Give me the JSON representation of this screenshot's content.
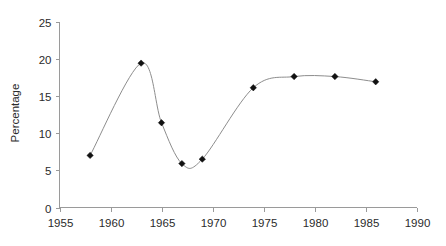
{
  "chart_data": {
    "type": "line",
    "title": "",
    "subtitle": "",
    "xlabel": "",
    "ylabel": "Percentage",
    "xlim": [
      1955,
      1990
    ],
    "ylim": [
      0,
      25
    ],
    "grid": false,
    "legend": null,
    "marker_style": "filled-diamond",
    "line_style": "smooth-spline",
    "x_ticks": [
      1955,
      1960,
      1965,
      1970,
      1975,
      1980,
      1985,
      1990
    ],
    "x_tick_labels": [
      "1955",
      "1960",
      "1965",
      "1970",
      "1975",
      "1980",
      "1985",
      "1990"
    ],
    "y_ticks": [
      0,
      5,
      10,
      15,
      20,
      25
    ],
    "y_tick_labels": [
      "0",
      "5",
      "10",
      "15",
      "20",
      "25"
    ],
    "series": [
      {
        "name": "Percentage",
        "color": "#8d8d8d",
        "marker_color": "#111111",
        "x": [
          1958,
          1963,
          1965,
          1967,
          1969,
          1974,
          1978,
          1982,
          1986
        ],
        "values": [
          7.0,
          19.4,
          11.4,
          5.9,
          6.5,
          16.1,
          17.6,
          17.6,
          16.9
        ],
        "points": [
          {
            "x": 1958,
            "y": 7.0
          },
          {
            "x": 1963,
            "y": 19.4
          },
          {
            "x": 1965,
            "y": 11.4
          },
          {
            "x": 1967,
            "y": 5.9
          },
          {
            "x": 1969,
            "y": 6.5
          },
          {
            "x": 1974,
            "y": 16.1
          },
          {
            "x": 1978,
            "y": 17.6
          },
          {
            "x": 1982,
            "y": 17.6
          },
          {
            "x": 1986,
            "y": 16.9
          }
        ]
      }
    ],
    "colors": {
      "line": "#8d8d8d",
      "marker": "#111111",
      "axis": "#9a9a9a",
      "text": "#2b2b2b",
      "background": "#ffffff"
    }
  }
}
